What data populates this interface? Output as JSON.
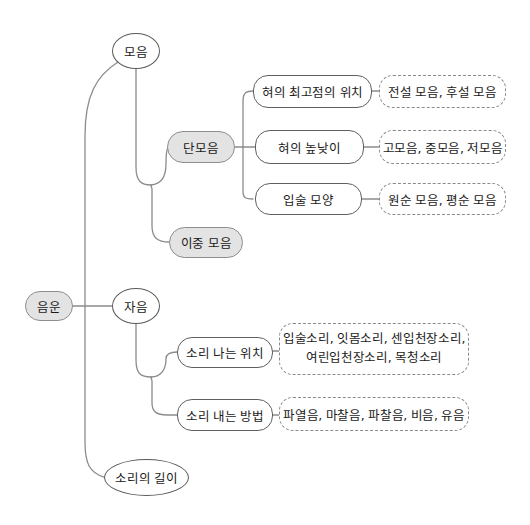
{
  "diagram_title": "phoneme-classification-tree",
  "nodes": {
    "root": {
      "label": "음운"
    },
    "vowel": {
      "label": "모음"
    },
    "monophthong": {
      "label": "단모음"
    },
    "diphthong": {
      "label": "이중 모음"
    },
    "tongue_position": {
      "label": "혀의 최고점의 위치",
      "result": "전설 모음, 후설 모음"
    },
    "tongue_height": {
      "label": "혀의 높낮이",
      "result": "고모음, 중모음, 저모음"
    },
    "lip_shape": {
      "label": "입술 모양",
      "result": "원순 모음, 평순 모음"
    },
    "consonant": {
      "label": "자음"
    },
    "place": {
      "label": "소리 나는 위치",
      "lines": [
        "입술소리, 잇몸소리, 센입천장소리,",
        "여린입천장소리, 목청소리"
      ]
    },
    "manner": {
      "label": "소리 내는 방법",
      "result": "파열음, 마찰음, 파찰음, 비음, 유음"
    },
    "length": {
      "label": "소리의 길이"
    }
  },
  "colors": {
    "highlight_fill": "#e3e3e3",
    "node_border": "#606060",
    "connector_line": "#8c8c8c",
    "background": "#ffffff",
    "text": "#1b1b1b"
  }
}
